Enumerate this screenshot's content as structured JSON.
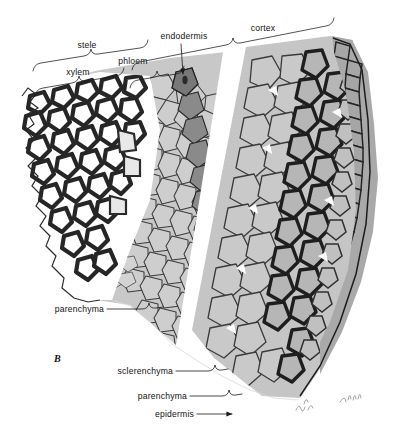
{
  "figure": {
    "panel_label": "B",
    "background_color": "#ffffff",
    "ink_color": "#1a1a1a"
  },
  "labels": {
    "stele": "stele",
    "xylem": "xylem",
    "phloem": "phloem",
    "endodermis": "endodermis",
    "cortex": "cortex",
    "parenchyma_inner": "parenchyma",
    "sclerenchyma": "sclerenchyma",
    "parenchyma_outer": "parenchyma",
    "epidermis": "epidermis"
  },
  "tissues": [
    {
      "name": "xylem",
      "tone": "#ffffff",
      "wall": "#2b2b2b",
      "note": "thick dark walls, white lumens"
    },
    {
      "name": "phloem",
      "tone": "#cfcfcf",
      "wall": "#3a3a3a",
      "note": "small thin-walled cells"
    },
    {
      "name": "endodermis",
      "tone": "#8f8f8f",
      "wall": "#2e2e2e",
      "note": "dark single cell ring"
    },
    {
      "name": "parenchyma",
      "tone": "#c4c4c4",
      "wall": "#3a3a3a",
      "note": "large rounded cells"
    },
    {
      "name": "sclerenchyma",
      "tone": "#b0b0b0",
      "wall": "#1f1f1f",
      "note": "very thick dark walls"
    },
    {
      "name": "epidermis",
      "tone": "#a8a8a8",
      "wall": "#262626",
      "note": "single outer rectangular layer"
    }
  ],
  "annotation_marks": {
    "handwriting_1": "dbl",
    "handwriting_2": "JEH"
  }
}
